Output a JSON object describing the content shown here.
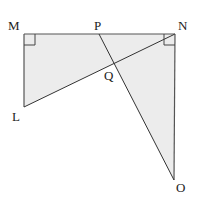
{
  "diagram": {
    "fill_color": "#ececec",
    "line_color": "#444444",
    "points": {
      "M": {
        "label": "M",
        "x": 24,
        "y": 34
      },
      "N": {
        "label": "N",
        "x": 175,
        "y": 34
      },
      "P": {
        "label": "P",
        "x": 99,
        "y": 34
      },
      "Q": {
        "label": "Q",
        "x": 115,
        "y": 64
      },
      "L": {
        "label": "L",
        "x": 24,
        "y": 107
      },
      "O": {
        "label": "O",
        "x": 174,
        "y": 180
      }
    },
    "right_angles": [
      "M",
      "N"
    ],
    "shaded_regions": [
      "triangle LMN",
      "triangle PNO"
    ],
    "segments": [
      "MN",
      "ML",
      "LN",
      "NO",
      "PO"
    ]
  }
}
